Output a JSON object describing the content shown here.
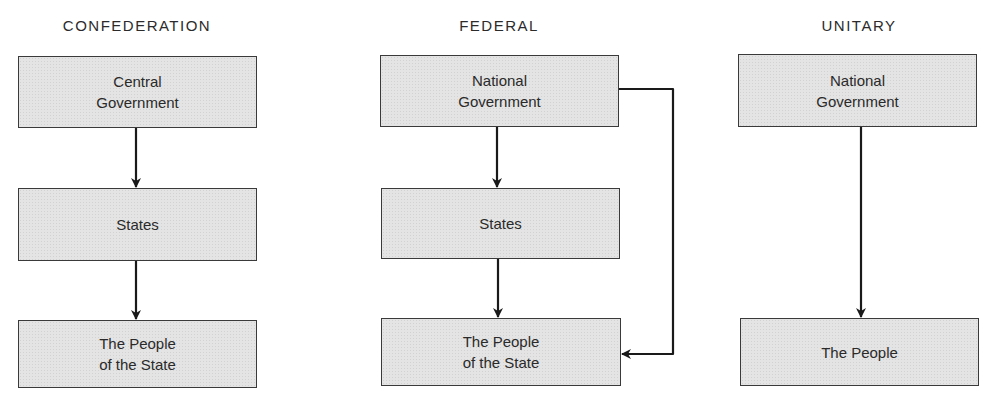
{
  "diagram": {
    "columns": [
      {
        "title": "CONFEDERATION",
        "boxes": [
          "Central\nGovernment",
          "States",
          "The People\nof the State"
        ],
        "arrows": [
          "Central Government → States",
          "States → The People of the State"
        ]
      },
      {
        "title": "FEDERAL",
        "boxes": [
          "National\nGovernment",
          "States",
          "The People\nof the State"
        ],
        "arrows": [
          "National Government → States",
          "States → The People of the State",
          "National Government → The People of the State"
        ]
      },
      {
        "title": "UNITARY",
        "boxes": [
          "National\nGovernment",
          "The People"
        ],
        "arrows": [
          "National Government → The People"
        ]
      }
    ],
    "colors": {
      "box_fill": "#e4e4e4",
      "border": "#3a3a3a",
      "arrow": "#1a1a1a",
      "text": "#2a2a2a"
    }
  }
}
